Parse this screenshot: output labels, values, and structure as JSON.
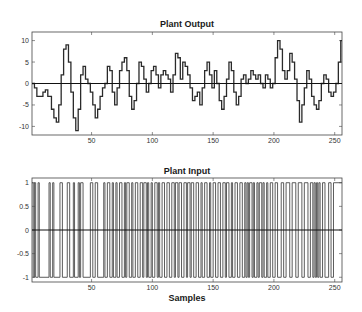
{
  "chart_data": [
    {
      "type": "line",
      "title": "Plant Output",
      "xlabel": "",
      "ylabel": "",
      "xlim": [
        1,
        256
      ],
      "ylim": [
        -12,
        12
      ],
      "xticks": [
        50,
        100,
        150,
        200,
        250
      ],
      "yticks": [
        10,
        5,
        0,
        -5,
        -10
      ],
      "grid": false,
      "step": true,
      "zero_line": true,
      "x": [
        1,
        3,
        5,
        8,
        10,
        12,
        14,
        17,
        19,
        21,
        23,
        25,
        27,
        29,
        31,
        33,
        35,
        37,
        39,
        41,
        43,
        45,
        47,
        49,
        51,
        53,
        55,
        57,
        59,
        61,
        63,
        65,
        67,
        69,
        71,
        73,
        75,
        77,
        79,
        81,
        83,
        85,
        87,
        89,
        91,
        93,
        95,
        97,
        99,
        101,
        103,
        105,
        107,
        109,
        111,
        113,
        115,
        117,
        119,
        121,
        123,
        125,
        127,
        129,
        131,
        133,
        135,
        137,
        139,
        141,
        143,
        145,
        147,
        149,
        151,
        153,
        155,
        157,
        159,
        161,
        163,
        165,
        167,
        169,
        171,
        173,
        175,
        177,
        179,
        181,
        183,
        185,
        187,
        189,
        191,
        193,
        195,
        197,
        199,
        201,
        203,
        205,
        207,
        209,
        211,
        213,
        215,
        217,
        219,
        221,
        223,
        225,
        227,
        229,
        231,
        233,
        235,
        237,
        239,
        241,
        243,
        245,
        247,
        249,
        251,
        253,
        255,
        256
      ],
      "values": [
        0,
        -1,
        -3,
        -3,
        -2,
        -1.5,
        -3,
        -6,
        -8,
        -9,
        -5,
        2,
        8,
        9,
        5,
        -2,
        -8,
        -11,
        -6,
        2,
        4,
        1,
        0,
        -2,
        -5,
        -8,
        -6,
        -3,
        -1,
        0,
        4,
        3,
        -2,
        -5,
        -1,
        3,
        5,
        6,
        3,
        -3,
        -6,
        -4,
        0,
        5,
        4,
        1,
        -2,
        0,
        3,
        4,
        2,
        -1,
        2,
        3,
        2,
        1,
        -2,
        2,
        7,
        6,
        1,
        5,
        4,
        2,
        -1,
        -4,
        -3,
        -2,
        -5,
        -1,
        3,
        5,
        2,
        -1,
        3,
        0,
        -4,
        -6,
        -3,
        1,
        5,
        3,
        -2,
        -5,
        -3,
        1,
        2,
        0,
        1,
        3,
        2,
        1,
        2,
        0,
        -1,
        2,
        1,
        -1,
        0,
        6,
        10,
        8,
        3,
        1,
        3,
        7,
        5,
        1,
        -4,
        -9,
        -5,
        -1,
        3,
        1,
        -3,
        -5,
        -6,
        -4,
        0,
        2,
        1,
        -2,
        -3,
        -2,
        0,
        5,
        10,
        10
      ]
    },
    {
      "type": "line",
      "title": "Plant Input",
      "xlabel": "Samples",
      "ylabel": "",
      "xlim": [
        1,
        256
      ],
      "ylim": [
        -1.1,
        1.1
      ],
      "xticks": [
        50,
        100,
        150,
        200,
        250
      ],
      "yticks": [
        1,
        0.5,
        0,
        -0.5,
        -1
      ],
      "ytick_labels": [
        "1",
        "0.5",
        "0",
        "-0.5",
        "-1"
      ],
      "grid": false,
      "step": true,
      "zero_line": true,
      "description": "Pseudo-random binary sequence switching between +1 and -1",
      "switch_samples": [
        1,
        2,
        3,
        4,
        6,
        7,
        15,
        16,
        18,
        19,
        24,
        26,
        30,
        32,
        35,
        36,
        39,
        40,
        41,
        43,
        49,
        51,
        53,
        55,
        60,
        61,
        63,
        65,
        67,
        68,
        70,
        71,
        73,
        75,
        77,
        78,
        79,
        81,
        83,
        84,
        86,
        88,
        90,
        92,
        93,
        95,
        96,
        97,
        99,
        100,
        102,
        104,
        105,
        106,
        108,
        110,
        112,
        114,
        116,
        118,
        119,
        121,
        122,
        124,
        126,
        128,
        129,
        131,
        132,
        134,
        136,
        138,
        140,
        141,
        143,
        145,
        147,
        148,
        150,
        152,
        154,
        156,
        158,
        160,
        161,
        163,
        165,
        166,
        168,
        170,
        172,
        174,
        176,
        177,
        178,
        179,
        180,
        182,
        183,
        184,
        186,
        187,
        188,
        190,
        191,
        192,
        194,
        195,
        197,
        199,
        201,
        203,
        206,
        208,
        210,
        213,
        215,
        218,
        220,
        223,
        225,
        228,
        230,
        232,
        233,
        234,
        235,
        236,
        237,
        238,
        240,
        242,
        245,
        247,
        249,
        256
      ],
      "start_value": 1
    }
  ],
  "tick_labels": {
    "x": [
      "50",
      "100",
      "150",
      "200",
      "250"
    ],
    "top_y": [
      "10",
      "5",
      "0",
      "-5",
      "-10"
    ],
    "bottom_y": [
      "1",
      "0.5",
      "0",
      "-0.5",
      "-1"
    ]
  },
  "titles": {
    "top": "Plant Output",
    "bottom": "Plant Input",
    "xlabel": "Samples"
  },
  "colors": {
    "line": "#2a2a2a",
    "input_line": "#4a4a4a",
    "axis": "#444444",
    "zero_line": "#111111"
  }
}
